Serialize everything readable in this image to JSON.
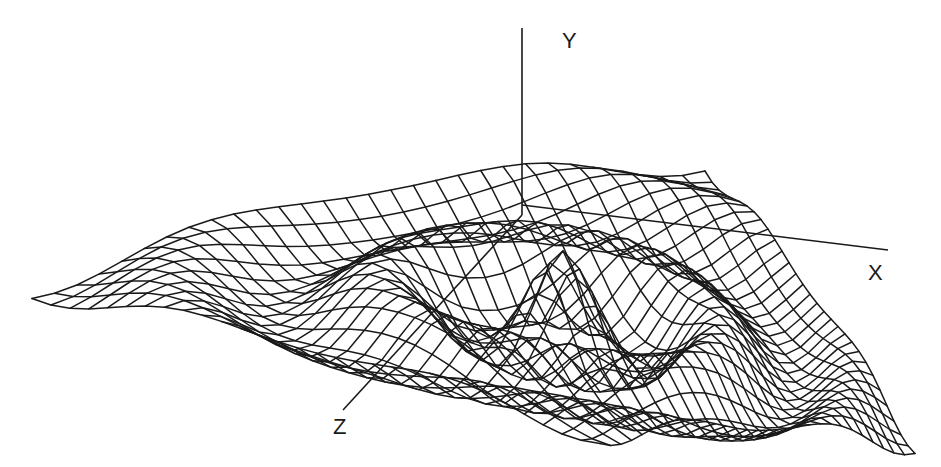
{
  "figure": {
    "type": "3d-wireframe-surface",
    "line_color": "#1a1a1a",
    "background": "#ffffff"
  },
  "axes": {
    "x": {
      "label": "X",
      "label_pos": [
        868,
        262
      ],
      "line": [
        [
          522,
          205
        ],
        [
          888,
          250
        ]
      ]
    },
    "y": {
      "label": "Y",
      "label_pos": [
        562,
        30
      ],
      "line": [
        [
          522,
          28
        ],
        [
          522,
          215
        ]
      ]
    },
    "z": {
      "label": "Z",
      "label_pos": [
        333,
        416
      ],
      "line": [
        [
          522,
          215
        ],
        [
          343,
          410
        ]
      ]
    }
  },
  "mesh": {
    "rows": 30,
    "cols": 30,
    "corners": {
      "left": [
        32,
        288
      ],
      "back": [
        705,
        150
      ],
      "right": [
        915,
        433
      ],
      "front": [
        600,
        433
      ]
    },
    "center": [
      522,
      212
    ],
    "ripple": {
      "amplitude": 55,
      "wavelength": 0.55,
      "decay": 1.1,
      "peak": 14
    }
  },
  "chart_data": {
    "type": "surface",
    "title": "",
    "xlabel": "X",
    "ylabel": "Y",
    "zlabel": "Z",
    "function": "y = A * cos(2*pi*r/lambda) * exp(-decay*r), r = sqrt(x^2+z^2)",
    "grid": "wireframe ~30x30",
    "legend": null
  }
}
